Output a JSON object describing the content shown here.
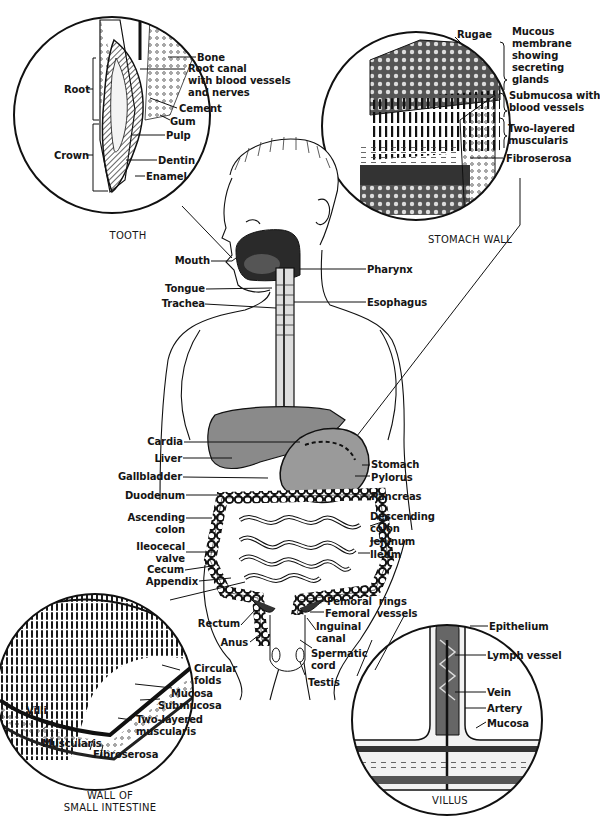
{
  "colors": {
    "background": "#ffffff",
    "ink": "#151515",
    "liver_fill": "#8a8a8a",
    "stomach_fill": "#9a9a9a"
  },
  "insets": {
    "tooth": {
      "caption": "TOOTH",
      "labels": {
        "bone": "Bone",
        "root_canal": "Root canal\nwith blood vessels\nand nerves",
        "cement": "Cement",
        "gum": "Gum",
        "pulp": "Pulp",
        "dentin": "Dentin",
        "enamel": "Enamel",
        "root": "Root",
        "crown": "Crown"
      }
    },
    "stomach_wall": {
      "caption": "STOMACH WALL",
      "labels": {
        "rugae": "Rugae",
        "mucous_membrane": "Mucous\nmembrane\nshowing\nsecreting\nglands",
        "submucosa": "Submucosa with\nblood vessels",
        "muscularis": "Two-layered\nmuscularis",
        "fibroserosa": "Fibroserosa"
      }
    },
    "small_intestine_wall": {
      "caption": "WALL OF\nSMALL INTESTINE",
      "labels": {
        "circular_folds": "Circular\nfolds",
        "mucosa": "Mucosa",
        "submucosa": "Submucosa",
        "two_layered_muscularis": "Two-layered\nmuscularis",
        "villi": "Villi",
        "muscularis": "Muscularis",
        "fibroserosa": "Fibroserosa"
      }
    },
    "villus": {
      "caption": "VILLUS",
      "labels": {
        "epithelium": "Epithelium",
        "lymph_vessel": "Lymph vessel",
        "vein": "Vein",
        "artery": "Artery",
        "mucosa": "Mucosa"
      }
    }
  },
  "body_labels": {
    "left": {
      "mouth": "Mouth",
      "tongue": "Tongue",
      "trachea": "Trachea",
      "cardia": "Cardia",
      "liver": "Liver",
      "gallbladder": "Gallbladder",
      "duodenum": "Duodenum",
      "ascending_colon": "Ascending\ncolon",
      "ileocecal_valve": "Ileocecal\nvalve",
      "cecum": "Cecum",
      "appendix": "Appendix",
      "rectum": "Rectum",
      "anus": "Anus"
    },
    "right": {
      "pharynx": "Pharynx",
      "esophagus": "Esophagus",
      "stomach": "Stomach",
      "pylorus": "Pylorus",
      "pancreas": "Pancreas",
      "descending_colon": "Descending\ncolon",
      "jejunum": "Jejunum",
      "ileum": "Ileum",
      "femoral_rings": "Femoral  rings",
      "femoral_vessels": "Femoral  vessels",
      "inguinal_canal": "Inguinal\ncanal",
      "spermatic_cord": "Spermatic\ncord",
      "testis": "Testis"
    }
  }
}
